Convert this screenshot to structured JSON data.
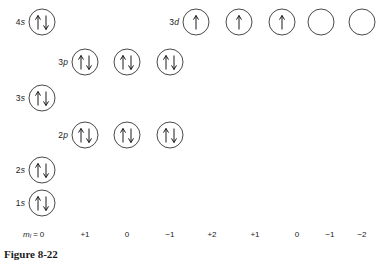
{
  "figure": {
    "caption": "Figure 8-22",
    "caption_x": 4,
    "caption_y": 248,
    "width": 376,
    "height": 262,
    "background": "#ffffff",
    "stroke_color": "#4a4a4a",
    "arrow_color": "#1a1a1a"
  },
  "axis": {
    "label_prefix": "m",
    "label_subscript": "l",
    "label_equals": " =",
    "label_x": 42,
    "y": 234,
    "tick_values": [
      "0",
      "+1",
      "0",
      "-1",
      "+2",
      "+1",
      "0",
      "-1",
      "-2"
    ],
    "tick_x": [
      42,
      85,
      127,
      170,
      212,
      255,
      297,
      330,
      362
    ]
  },
  "rows": [
    {
      "label": "4",
      "label_italic": "s",
      "y": 22,
      "label_x": 28,
      "orbitals": [
        {
          "x": 42,
          "spin": "pair"
        }
      ]
    },
    {
      "label": "3",
      "label_italic": "d",
      "y": 22,
      "label_x": 182,
      "orbitals": [
        {
          "x": 196,
          "spin": "up"
        },
        {
          "x": 239,
          "spin": "up"
        },
        {
          "x": 282,
          "spin": "up"
        },
        {
          "x": 321,
          "spin": "empty"
        },
        {
          "x": 362,
          "spin": "empty"
        }
      ]
    },
    {
      "label": "3",
      "label_italic": "p",
      "y": 62,
      "label_x": 71,
      "orbitals": [
        {
          "x": 85,
          "spin": "pair"
        },
        {
          "x": 127,
          "spin": "pair"
        },
        {
          "x": 170,
          "spin": "pair"
        }
      ]
    },
    {
      "label": "3",
      "label_italic": "s",
      "y": 98,
      "label_x": 28,
      "orbitals": [
        {
          "x": 42,
          "spin": "pair"
        }
      ]
    },
    {
      "label": "2",
      "label_italic": "p",
      "y": 135,
      "label_x": 71,
      "orbitals": [
        {
          "x": 85,
          "spin": "pair"
        },
        {
          "x": 127,
          "spin": "pair"
        },
        {
          "x": 170,
          "spin": "pair"
        }
      ]
    },
    {
      "label": "2",
      "label_italic": "s",
      "y": 170,
      "label_x": 28,
      "orbitals": [
        {
          "x": 42,
          "spin": "pair"
        }
      ]
    },
    {
      "label": "1",
      "label_italic": "s",
      "y": 203,
      "label_x": 28,
      "orbitals": [
        {
          "x": 42,
          "spin": "pair"
        }
      ]
    }
  ]
}
